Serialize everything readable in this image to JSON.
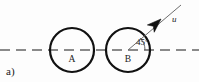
{
  "figure": {
    "panel_label": "a)",
    "background_color": "#fdfdfd",
    "width": 199,
    "height": 82,
    "centerline": {
      "color": "#8a8a8a",
      "y": 50,
      "x_start": 0,
      "x_end": 199,
      "dash": "10 6",
      "width": 2
    },
    "circles": [
      {
        "label": "A",
        "cx": 72,
        "cy": 50,
        "r": 22,
        "stroke_color": "#111111",
        "stroke_width": 2.2,
        "fill": "none",
        "label_x": 72,
        "label_y": 62
      },
      {
        "label": "B",
        "cx": 128,
        "cy": 50,
        "r": 22,
        "stroke_color": "#111111",
        "stroke_width": 2.2,
        "fill": "none",
        "label_x": 128,
        "label_y": 62
      }
    ],
    "velocity_vector": {
      "label": "u",
      "label_x": 172,
      "label_y": 22,
      "origin_x": 128,
      "origin_y": 50,
      "tip_x": 161,
      "tip_y": 19,
      "tail_x": 181,
      "tail_y": 5,
      "line_color": "#6e6e6e",
      "line_width": 1,
      "head_color": "#111111",
      "angle_degrees": 45
    },
    "angle_annotation": {
      "label": "45°",
      "label_x": 136,
      "label_y": 45,
      "arc_radius": 17,
      "arc_color": "#555555",
      "arc_width": 0.9
    },
    "panel_label_x": 6,
    "panel_label_y": 75
  }
}
